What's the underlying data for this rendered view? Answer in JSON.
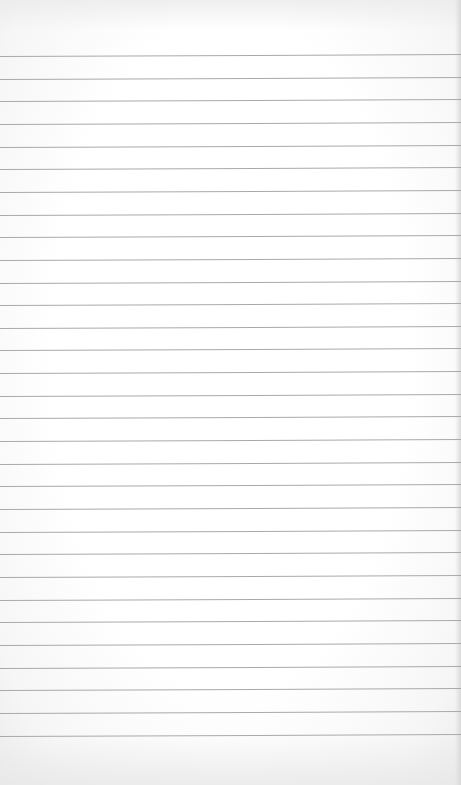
{
  "image": {
    "subject": "blank lined notebook paper",
    "width": 461,
    "height": 785,
    "background_color": "#fdfdfd",
    "line_color": "#a9a9a9",
    "edge_shadow_color": "#d7d7d7"
  },
  "paper": {
    "line_count": 31,
    "first_line_y": 56,
    "line_spacing": 22.65,
    "line_tilt_deg": -0.25,
    "text_content": ""
  }
}
